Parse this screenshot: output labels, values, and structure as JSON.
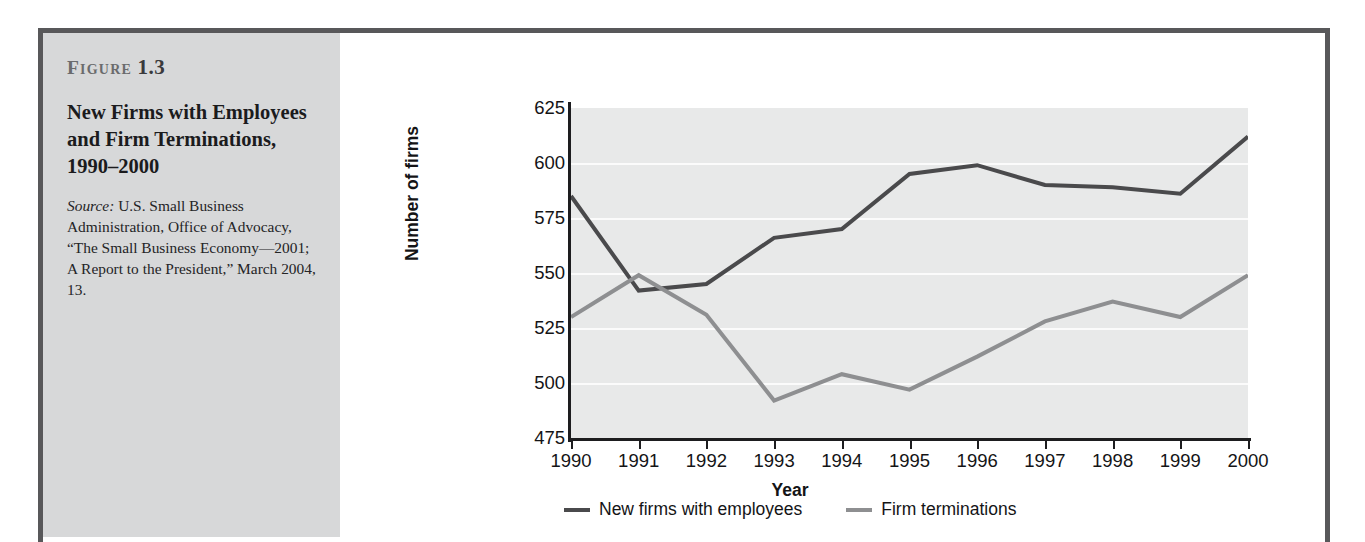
{
  "figure": {
    "label_word": "Figure",
    "label_number": "1.3",
    "title": "New Firms with Employees and Firm Terminations, 1990–2000",
    "source_word": "Source:",
    "source_text": " U.S. Small Business Administration, Office of Advocacy, “The Small Business Economy—2001; A Report to the President,” March 2004, 13."
  },
  "colors": {
    "panel_background": "#d7d8d9",
    "frame_border": "#58585a",
    "plot_background": "#e8e9e9",
    "gridline": "#fbfbfb",
    "axis": "#1d1d1f",
    "series_new_firms": "#4a4a4c",
    "series_terminations": "#8e8f91"
  },
  "chart_data": {
    "type": "line",
    "title": "New Firms with Employees and Firm Terminations, 1990–2000",
    "xlabel": "Year",
    "ylabel": "Number of firms",
    "categories": [
      "1990",
      "1991",
      "1992",
      "1993",
      "1994",
      "1995",
      "1996",
      "1997",
      "1998",
      "1999",
      "2000"
    ],
    "x": [
      1990,
      1991,
      1992,
      1993,
      1994,
      1995,
      1996,
      1997,
      1998,
      1999,
      2000
    ],
    "ylim": [
      475,
      625
    ],
    "yticks": [
      475,
      500,
      525,
      550,
      575,
      600,
      625
    ],
    "ytick_labels": [
      "475",
      "500",
      "525",
      "550",
      "575",
      "600",
      "625"
    ],
    "gridlines": [
      500,
      525,
      550,
      575,
      600
    ],
    "grid": true,
    "legend_position": "bottom",
    "series": [
      {
        "name": "New firms with employees",
        "color": "#4a4a4c",
        "values": [
          585,
          542,
          545,
          566,
          570,
          595,
          599,
          590,
          589,
          586,
          612
        ]
      },
      {
        "name": "Firm terminations",
        "color": "#8e8f91",
        "values": [
          530,
          549,
          531,
          492,
          504,
          497,
          512,
          528,
          537,
          530,
          549
        ]
      }
    ]
  }
}
